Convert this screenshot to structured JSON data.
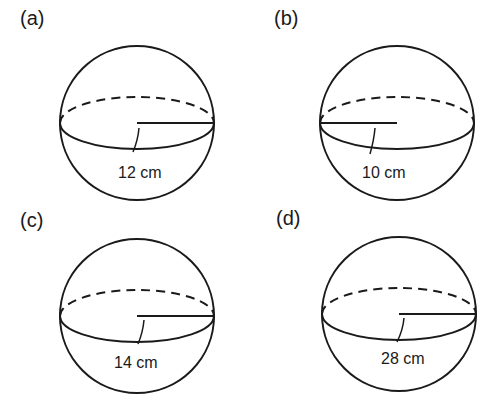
{
  "figure": {
    "panels": [
      {
        "label": "(a)",
        "radius_label": "12 cm",
        "radius_side": "right"
      },
      {
        "label": "(b)",
        "radius_label": "10 cm",
        "radius_side": "left"
      },
      {
        "label": "(c)",
        "radius_label": "14 cm",
        "radius_side": "right"
      },
      {
        "label": "(d)",
        "radius_label": "28 cm",
        "radius_side": "right"
      }
    ]
  }
}
